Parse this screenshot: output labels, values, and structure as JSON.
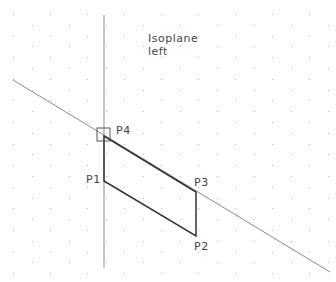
{
  "view": {
    "title_line1": "Isoplane",
    "title_line2": "left",
    "background": "#ffffff",
    "grid_dot_color": "#b5b5b5",
    "construction_line_color": "#8a8a8a",
    "shape_line_color": "#333333"
  },
  "points": [
    {
      "label": "P1",
      "x": 104,
      "y": 181
    },
    {
      "label": "P2",
      "x": 196,
      "y": 236
    },
    {
      "label": "P3",
      "x": 196,
      "y": 192
    },
    {
      "label": "P4",
      "x": 104,
      "y": 136
    }
  ],
  "labels": {
    "p1": "P1",
    "p2": "P2",
    "p3": "P3",
    "p4": "P4"
  }
}
